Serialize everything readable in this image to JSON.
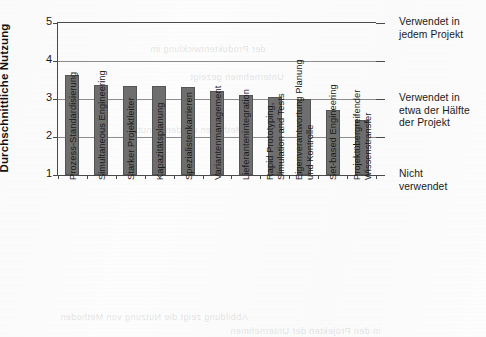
{
  "chart_data": {
    "type": "bar",
    "title": "",
    "xlabel": "",
    "ylabel": "Durchschnittliche Nutzung",
    "ylim": [
      1,
      5
    ],
    "yticks": [
      1,
      2,
      3,
      4,
      5
    ],
    "grid": true,
    "legend": "none",
    "bar_color": "#6e6e6e",
    "categories": [
      "Prozess-Standardisierung",
      "Simultaneous Engineering",
      "Starker Projektleiter",
      "Kapazitätsplanung",
      "Spezialistenkarrieren",
      "Variantenmanagement",
      "Lieferantenintegration",
      "Rapid Prototyping,\nSimulation and Tests",
      "Eigenverantwortung Planung\nund Kontrolle",
      "Set-based Engineering",
      "Projektübergreifender\nWissenstransfer"
    ],
    "values": [
      3.63,
      3.36,
      3.35,
      3.34,
      3.31,
      3.2,
      3.11,
      3.05,
      3.0,
      2.71,
      2.45
    ],
    "annotations": [
      {
        "value": 5,
        "text_line1": "Verwendet in",
        "text_line2": "jedem Projekt"
      },
      {
        "value": 3,
        "text_line1": "Verwendet in",
        "text_line2": "etwa der Hälfte",
        "text_line3": "der Projekt"
      },
      {
        "value": 1,
        "text_line1": "Nicht",
        "text_line2": "verwendet"
      }
    ]
  },
  "axis": {
    "y_title": "Durchschnittliche Nutzung",
    "y_tick_labels": [
      "5",
      "4",
      "3",
      "2",
      "1"
    ]
  }
}
